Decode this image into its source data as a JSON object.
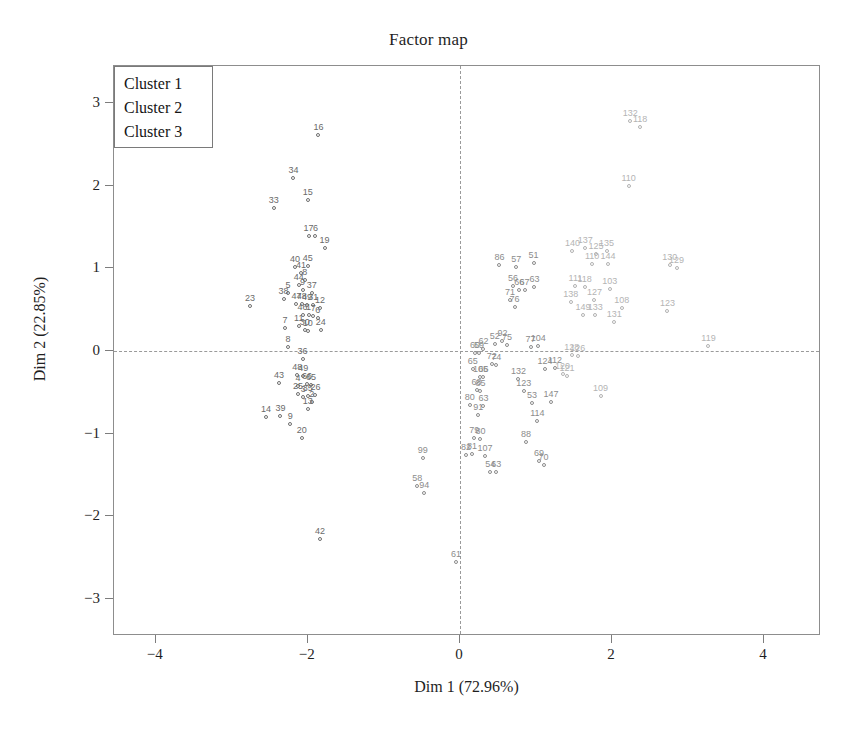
{
  "chart_data": {
    "type": "scatter",
    "title": "Factor map",
    "xlabel": "Dim 1 (72.96%)",
    "ylabel": "Dim 2 (22.85%)",
    "xlim": [
      -4.55,
      4.75
    ],
    "ylim": [
      -3.45,
      3.45
    ],
    "xticks": [
      -4,
      -2,
      0,
      2,
      4
    ],
    "xticklabels": [
      "−4",
      "−2",
      "0",
      "2",
      "4"
    ],
    "yticks": [
      3,
      2,
      1,
      0,
      -1,
      -2,
      -3
    ],
    "yticklabels": [
      "3",
      "2",
      "1",
      "0",
      "−1",
      "−2",
      "−3"
    ],
    "grid": false,
    "reference_lines": {
      "x": 0,
      "y": 0,
      "style": "dashed"
    },
    "legend": {
      "position": "top-left",
      "entries": [
        {
          "label": "Cluster 1",
          "color": "#6a6a6a"
        },
        {
          "label": "Cluster 2",
          "color": "#8c8c8c"
        },
        {
          "label": "Cluster 3",
          "color": "#b4b4b4"
        }
      ]
    },
    "series": [
      {
        "name": "Cluster 1",
        "color": "#6a6a6a",
        "points": [
          {
            "label": "16",
            "x": -1.86,
            "y": 2.62
          },
          {
            "label": "34",
            "x": -2.19,
            "y": 2.1
          },
          {
            "label": "15",
            "x": -2.0,
            "y": 1.83
          },
          {
            "label": "33",
            "x": -2.45,
            "y": 1.73
          },
          {
            "label": "17",
            "x": -1.99,
            "y": 1.39
          },
          {
            "label": "6",
            "x": -1.9,
            "y": 1.39
          },
          {
            "label": "19",
            "x": -1.78,
            "y": 1.25
          },
          {
            "label": "40",
            "x": -2.17,
            "y": 1.02
          },
          {
            "label": "45",
            "x": -2.0,
            "y": 1.03
          },
          {
            "label": "41",
            "x": -2.09,
            "y": 0.94
          },
          {
            "label": "8",
            "x": -2.04,
            "y": 0.86
          },
          {
            "label": "44",
            "x": -2.12,
            "y": 0.8
          },
          {
            "label": "9",
            "x": -2.07,
            "y": 0.74
          },
          {
            "label": "5",
            "x": -2.26,
            "y": 0.7
          },
          {
            "label": "37",
            "x": -1.95,
            "y": 0.7
          },
          {
            "label": "38",
            "x": -2.32,
            "y": 0.63
          },
          {
            "label": "23",
            "x": -2.76,
            "y": 0.55
          },
          {
            "label": "47",
            "x": -2.15,
            "y": 0.57
          },
          {
            "label": "48",
            "x": -2.08,
            "y": 0.57
          },
          {
            "label": "49",
            "x": -2.01,
            "y": 0.56
          },
          {
            "label": "31",
            "x": -1.93,
            "y": 0.56
          },
          {
            "label": "12",
            "x": -1.84,
            "y": 0.52
          },
          {
            "label": "46",
            "x": -2.07,
            "y": 0.44
          },
          {
            "label": "1",
            "x": -1.99,
            "y": 0.43
          },
          {
            "label": "7",
            "x": -1.93,
            "y": 0.42
          },
          {
            "label": "6b",
            "x": -1.87,
            "y": 0.4
          },
          {
            "label": "7",
            "x": -2.3,
            "y": 0.28
          },
          {
            "label": "11",
            "x": -2.12,
            "y": 0.3
          },
          {
            "label": "30",
            "x": -2.04,
            "y": 0.25
          },
          {
            "label": "10",
            "x": -2.0,
            "y": 0.24
          },
          {
            "label": "24",
            "x": -1.83,
            "y": 0.26
          },
          {
            "label": "8b",
            "x": -2.26,
            "y": 0.05
          },
          {
            "label": "36",
            "x": -2.07,
            "y": -0.1
          },
          {
            "label": "48b",
            "x": -2.14,
            "y": -0.29
          },
          {
            "label": "49b",
            "x": -2.06,
            "y": -0.3
          },
          {
            "label": "43",
            "x": -2.38,
            "y": -0.39
          },
          {
            "label": "4",
            "x": -2.13,
            "y": -0.42
          },
          {
            "label": "66",
            "x": -2.01,
            "y": -0.4
          },
          {
            "label": "65",
            "x": -1.96,
            "y": -0.41
          },
          {
            "label": "25",
            "x": -2.13,
            "y": -0.52
          },
          {
            "label": "3",
            "x": -2.06,
            "y": -0.56
          },
          {
            "label": "35",
            "x": -2.0,
            "y": -0.55
          },
          {
            "label": "26",
            "x": -1.9,
            "y": -0.53
          },
          {
            "label": "2",
            "x": -1.95,
            "y": -0.62
          },
          {
            "label": "13",
            "x": -2.0,
            "y": -0.7
          },
          {
            "label": "14",
            "x": -2.55,
            "y": -0.8
          },
          {
            "label": "39",
            "x": -2.36,
            "y": -0.79
          },
          {
            "label": "9b",
            "x": -2.23,
            "y": -0.88
          },
          {
            "label": "20",
            "x": -2.08,
            "y": -1.05
          },
          {
            "label": "42",
            "x": -1.84,
            "y": -2.28
          }
        ]
      },
      {
        "name": "Cluster 2",
        "color": "#8c8c8c",
        "points": [
          {
            "label": "86",
            "x": 0.52,
            "y": 1.04
          },
          {
            "label": "57",
            "x": 0.74,
            "y": 1.02
          },
          {
            "label": "51",
            "x": 0.97,
            "y": 1.06
          },
          {
            "label": "56",
            "x": 0.7,
            "y": 0.79
          },
          {
            "label": "66",
            "x": 0.78,
            "y": 0.74
          },
          {
            "label": "67",
            "x": 0.85,
            "y": 0.74
          },
          {
            "label": "63",
            "x": 0.98,
            "y": 0.78
          },
          {
            "label": "71",
            "x": 0.66,
            "y": 0.62
          },
          {
            "label": "76",
            "x": 0.72,
            "y": 0.53
          },
          {
            "label": "92",
            "x": 0.56,
            "y": 0.12
          },
          {
            "label": "52",
            "x": 0.46,
            "y": 0.08
          },
          {
            "label": "75",
            "x": 0.62,
            "y": 0.07
          },
          {
            "label": "77",
            "x": 0.93,
            "y": 0.05
          },
          {
            "label": "104",
            "x": 1.03,
            "y": 0.06
          },
          {
            "label": "62",
            "x": 0.31,
            "y": 0.02
          },
          {
            "label": "60",
            "x": 0.2,
            "y": -0.02
          },
          {
            "label": "59",
            "x": 0.25,
            "y": -0.03
          },
          {
            "label": "72",
            "x": 0.42,
            "y": -0.16
          },
          {
            "label": "74",
            "x": 0.48,
            "y": -0.17
          },
          {
            "label": "65",
            "x": 0.17,
            "y": -0.22
          },
          {
            "label": "105",
            "x": 0.27,
            "y": -0.32
          },
          {
            "label": "66b",
            "x": 0.31,
            "y": -0.32
          },
          {
            "label": "132",
            "x": 0.77,
            "y": -0.34
          },
          {
            "label": "124",
            "x": 1.12,
            "y": -0.22
          },
          {
            "label": "112",
            "x": 1.25,
            "y": -0.21
          },
          {
            "label": "68",
            "x": 0.22,
            "y": -0.47
          },
          {
            "label": "85",
            "x": 0.27,
            "y": -0.49
          },
          {
            "label": "123",
            "x": 0.84,
            "y": -0.48
          },
          {
            "label": "80",
            "x": 0.13,
            "y": -0.65
          },
          {
            "label": "63b",
            "x": 0.31,
            "y": -0.66
          },
          {
            "label": "53",
            "x": 0.95,
            "y": -0.63
          },
          {
            "label": "147",
            "x": 1.2,
            "y": -0.62
          },
          {
            "label": "91",
            "x": 0.24,
            "y": -0.78
          },
          {
            "label": "114",
            "x": 1.02,
            "y": -0.85
          },
          {
            "label": "79",
            "x": 0.19,
            "y": -1.05
          },
          {
            "label": "80b",
            "x": 0.27,
            "y": -1.06
          },
          {
            "label": "88",
            "x": 0.87,
            "y": -1.1
          },
          {
            "label": "82",
            "x": 0.08,
            "y": -1.26
          },
          {
            "label": "81",
            "x": 0.16,
            "y": -1.25
          },
          {
            "label": "107",
            "x": 0.33,
            "y": -1.27
          },
          {
            "label": "99",
            "x": -0.49,
            "y": -1.29
          },
          {
            "label": "69",
            "x": 1.04,
            "y": -1.33
          },
          {
            "label": "70",
            "x": 1.1,
            "y": -1.38
          },
          {
            "label": "54",
            "x": 0.4,
            "y": -1.47
          },
          {
            "label": "63c",
            "x": 0.48,
            "y": -1.47
          },
          {
            "label": "58",
            "x": -0.56,
            "y": -1.63
          },
          {
            "label": "94",
            "x": -0.47,
            "y": -1.72
          },
          {
            "label": "61",
            "x": -0.05,
            "y": -2.56
          }
        ]
      },
      {
        "name": "Cluster 3",
        "color": "#b4b4b4",
        "points": [
          {
            "label": "132",
            "x": 2.24,
            "y": 2.78
          },
          {
            "label": "118",
            "x": 2.37,
            "y": 2.71
          },
          {
            "label": "110",
            "x": 2.22,
            "y": 2.0
          },
          {
            "label": "140",
            "x": 1.48,
            "y": 1.21
          },
          {
            "label": "137",
            "x": 1.65,
            "y": 1.25
          },
          {
            "label": "125",
            "x": 1.79,
            "y": 1.18
          },
          {
            "label": "135",
            "x": 1.93,
            "y": 1.21
          },
          {
            "label": "110b",
            "x": 1.74,
            "y": 1.05
          },
          {
            "label": "144",
            "x": 1.95,
            "y": 1.05
          },
          {
            "label": "130",
            "x": 2.76,
            "y": 1.04
          },
          {
            "label": "129",
            "x": 2.85,
            "y": 1.0
          },
          {
            "label": "111",
            "x": 1.52,
            "y": 0.79
          },
          {
            "label": "118b",
            "x": 1.64,
            "y": 0.78
          },
          {
            "label": "103",
            "x": 1.97,
            "y": 0.75
          },
          {
            "label": "138",
            "x": 1.46,
            "y": 0.59
          },
          {
            "label": "127",
            "x": 1.77,
            "y": 0.62
          },
          {
            "label": "108",
            "x": 2.13,
            "y": 0.52
          },
          {
            "label": "123",
            "x": 2.73,
            "y": 0.49
          },
          {
            "label": "149",
            "x": 1.62,
            "y": 0.43
          },
          {
            "label": "133",
            "x": 1.78,
            "y": 0.44
          },
          {
            "label": "131",
            "x": 2.03,
            "y": 0.35
          },
          {
            "label": "119",
            "x": 3.27,
            "y": 0.06
          },
          {
            "label": "128",
            "x": 1.47,
            "y": -0.05
          },
          {
            "label": "126",
            "x": 1.55,
            "y": -0.06
          },
          {
            "label": "109",
            "x": 1.85,
            "y": -0.55
          },
          {
            "label": "120",
            "x": 1.35,
            "y": -0.28
          },
          {
            "label": "121",
            "x": 1.41,
            "y": -0.3
          }
        ]
      }
    ]
  }
}
